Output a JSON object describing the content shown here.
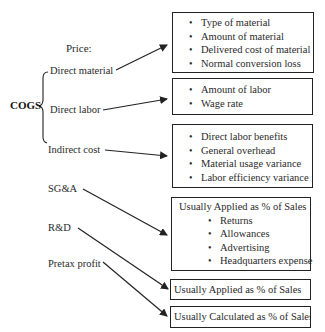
{
  "title": "Price:",
  "cogs": {
    "label": "COGS",
    "items": [
      {
        "label": "Direct material"
      },
      {
        "label": "Direct labor"
      },
      {
        "label": "Indirect cost"
      }
    ]
  },
  "other_items": [
    {
      "label": "SG&A"
    },
    {
      "label": "R&D"
    },
    {
      "label": "Pretax profit"
    }
  ],
  "boxes": {
    "direct_material": {
      "bullets": [
        "Type of material",
        "Amount of material",
        "Delivered cost of material",
        "Normal conversion loss"
      ]
    },
    "direct_labor": {
      "bullets": [
        "Amount of labor",
        "Wage rate"
      ]
    },
    "indirect_cost": {
      "bullets": [
        "Direct labor benefits",
        "General overhead",
        "Material usage variance",
        "Labor efficiency variance"
      ]
    },
    "sga": {
      "heading": "Usually Applied as % of Sales",
      "bullets": [
        "Returns",
        "Allowances",
        "Advertising",
        "Headquarters expense"
      ]
    },
    "rd": {
      "heading": "Usually Applied as % of Sales"
    },
    "pretax": {
      "heading": "Usually Calculated as % of Sales"
    }
  },
  "colors": {
    "line": "#222222",
    "text": "#2a2a2a"
  }
}
